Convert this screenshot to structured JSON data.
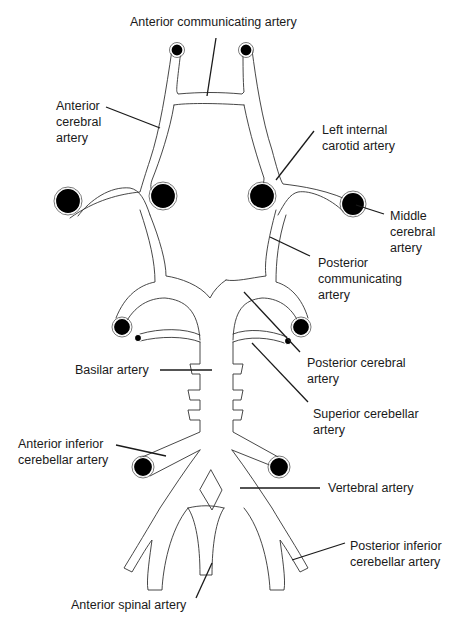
{
  "diagram": {
    "colors": {
      "line": "#333333",
      "vessel_end": "#000000",
      "background": "#ffffff",
      "text": "#1a1a1a"
    },
    "labels": {
      "anterior_communicating": "Anterior communicating artery",
      "anterior_cerebral": "Anterior\ncerebral\nartery",
      "left_internal_carotid": "Left internal\ncarotid artery",
      "middle_cerebral": "Middle\ncerebral\nartery",
      "posterior_communicating": "Posterior\ncommunicating\nartery",
      "posterior_cerebral": "Posterior cerebral\nartery",
      "basilar": "Basilar artery",
      "superior_cerebellar": "Superior cerebellar\nartery",
      "anterior_inferior_cerebellar": "Anterior inferior\ncerebellar artery",
      "vertebral": "Vertebral artery",
      "posterior_inferior_cerebellar": "Posterior inferior\ncerebellar artery",
      "anterior_spinal": "Anterior spinal artery"
    }
  }
}
